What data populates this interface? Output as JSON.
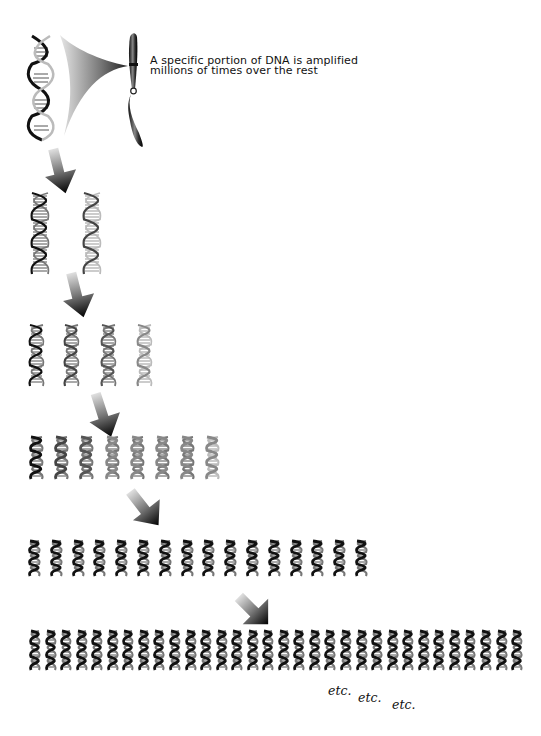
{
  "diagram": {
    "caption_lines": [
      "A specific portion of DNA is amplified",
      "millions of times over the rest"
    ],
    "source": {
      "element": "chromosome",
      "dna": "large double helix",
      "link": "gray gradient wedge from DNA segment to chromosome band"
    },
    "generations": [
      {
        "row": 1,
        "copies": 1
      },
      {
        "row": 2,
        "copies": 2
      },
      {
        "row": 3,
        "copies": 4
      },
      {
        "row": 4,
        "copies": 8
      },
      {
        "row": 5,
        "copies": 16
      },
      {
        "row": 6,
        "copies": 32
      }
    ],
    "arrows_count": 5,
    "etc_labels": [
      "etc.",
      "etc.",
      "etc."
    ],
    "colors": {
      "ink": "#111111",
      "gray_dark": "#333333",
      "gray_light": "#bbbbbb",
      "background": "#ffffff"
    }
  }
}
